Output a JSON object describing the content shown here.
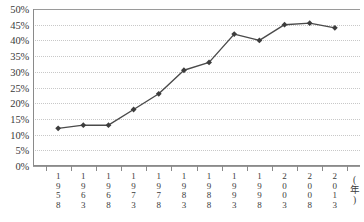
{
  "chart_data": {
    "type": "line",
    "title": "",
    "subtitle": "",
    "xlabel": "(年)",
    "ylabel": "",
    "categories": [
      "1958",
      "1963",
      "1968",
      "1973",
      "1978",
      "1983",
      "1988",
      "1993",
      "1998",
      "2003",
      "2008",
      "2013"
    ],
    "values": [
      12,
      13,
      13,
      18,
      23,
      30.5,
      33,
      42,
      40,
      45,
      45.5,
      44
    ],
    "ylim": [
      0,
      50
    ],
    "ytick_labels": [
      "50%",
      "45%",
      "40%",
      "35%",
      "30%",
      "25%",
      "20%",
      "15%",
      "10%",
      "5%",
      "0%"
    ],
    "ytick_values": [
      50,
      45,
      40,
      35,
      30,
      25,
      20,
      15,
      10,
      5,
      0
    ],
    "ytick_suffix": "%",
    "grid": true,
    "grid_style": "dotted",
    "legend": false,
    "legend_position": "none",
    "series": [
      {
        "name": "",
        "values": [
          12,
          13,
          13,
          18,
          23,
          30.5,
          33,
          42,
          40,
          45,
          45.5,
          44
        ]
      }
    ],
    "marker": "diamond",
    "colors": {
      "line": "#4a4a4a",
      "marker": "#3d3d3d",
      "grid": "#c8c8c8",
      "axis": "#8a8a8a",
      "text": "#3a3a3a",
      "background": "#ffffff"
    }
  },
  "axis_unit_chars": [
    "(",
    "年",
    ")"
  ]
}
